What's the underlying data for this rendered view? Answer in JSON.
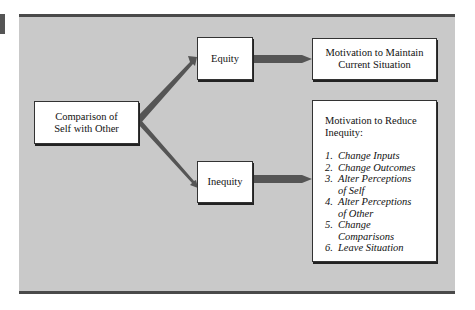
{
  "diagram": {
    "nodes": {
      "comparison": {
        "label_line1": "Comparison of",
        "label_line2": "Self with Other"
      },
      "equity": {
        "label": "Equity"
      },
      "inequity": {
        "label": "Inequity"
      },
      "maintain": {
        "label_line1": "Motivation to Maintain",
        "label_line2": "Current Situation"
      },
      "reduce": {
        "heading_line1": "Motivation to Reduce",
        "heading_line2": "Inequity:",
        "items": [
          {
            "num": "1.",
            "line1": "Change Inputs",
            "line2": ""
          },
          {
            "num": "2.",
            "line1": "Change Outcomes",
            "line2": ""
          },
          {
            "num": "3.",
            "line1": "Alter Perceptions",
            "line2": "of Self"
          },
          {
            "num": "4.",
            "line1": "Alter Perceptions",
            "line2": "of Other"
          },
          {
            "num": "5.",
            "line1": "Change Comparisons",
            "line2": ""
          },
          {
            "num": "6.",
            "line1": "Leave Situation",
            "line2": ""
          }
        ]
      }
    },
    "edges": [
      {
        "from": "comparison",
        "to": "equity"
      },
      {
        "from": "comparison",
        "to": "inequity"
      },
      {
        "from": "equity",
        "to": "maintain"
      },
      {
        "from": "inequity",
        "to": "reduce"
      }
    ],
    "colors": {
      "panel": "#c9c9c9",
      "arrow": "#555555",
      "border": "#4a4a4a"
    }
  }
}
